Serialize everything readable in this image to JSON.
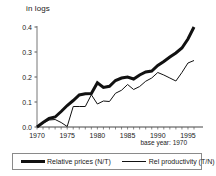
{
  "chart_data": {
    "type": "line",
    "title": "in logs",
    "xlabel": "",
    "ylabel": "in logs",
    "annotation": "base year: 1970",
    "grid": false,
    "legend_position": "bottom",
    "xlim": [
      1970,
      1996
    ],
    "ylim": [
      0.0,
      0.4
    ],
    "yticks": [
      "0.0",
      "0.1",
      "0.2",
      "0.3",
      "0.4"
    ],
    "ytick_values": [
      0.0,
      0.1,
      0.2,
      0.3,
      0.4
    ],
    "xticks": [
      "1970",
      "1975",
      "1980",
      "1985",
      "1990",
      "1995"
    ],
    "xtick_values": [
      1970,
      1975,
      1980,
      1985,
      1990,
      1995
    ],
    "x": [
      1970,
      1971,
      1972,
      1973,
      1974,
      1975,
      1976,
      1977,
      1978,
      1979,
      1980,
      1981,
      1982,
      1983,
      1984,
      1985,
      1986,
      1987,
      1988,
      1989,
      1990,
      1991,
      1992,
      1993,
      1994,
      1995,
      1996
    ],
    "series": [
      {
        "name": "Relative prices (N/T)",
        "style": "thick",
        "color": "#111111",
        "values": [
          0.0,
          0.018,
          0.034,
          0.04,
          0.062,
          0.086,
          0.106,
          0.128,
          0.133,
          0.134,
          0.177,
          0.158,
          0.163,
          0.186,
          0.196,
          0.2,
          0.192,
          0.208,
          0.22,
          0.224,
          0.246,
          0.262,
          0.28,
          0.296,
          0.316,
          0.352,
          0.4
        ]
      },
      {
        "name": "Rel productivity (T/N)",
        "style": "thin",
        "color": "#111111",
        "values": [
          0.0,
          0.016,
          0.028,
          0.03,
          0.018,
          0.002,
          0.082,
          0.082,
          0.082,
          0.129,
          0.092,
          0.104,
          0.102,
          0.135,
          0.147,
          0.17,
          0.15,
          0.162,
          0.183,
          0.196,
          0.218,
          0.208,
          0.196,
          0.184,
          0.218,
          0.256,
          0.266
        ]
      }
    ]
  },
  "legend": {
    "items": [
      {
        "label": "Relative prices (N/T)",
        "style": "thick"
      },
      {
        "label": "Rel productivity (T/N)",
        "style": "thin"
      }
    ]
  },
  "axis_title": "in logs",
  "note": "base year: 1970"
}
